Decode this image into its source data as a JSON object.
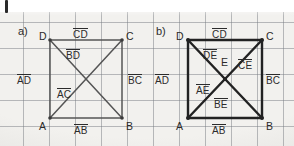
{
  "page": {
    "background_color": "#f2f1ee",
    "grid_color": "#787d82",
    "ink_color": "#2b2b2b",
    "grid_spacing_px": 26,
    "top_tick_mark": "|"
  },
  "panels": [
    {
      "tag": "a)",
      "id": "panel-a",
      "line_weight": "thin",
      "line_color": "#555555",
      "square": {
        "left": 50,
        "top": 40,
        "right": 122,
        "bottom": 118
      },
      "vertices": [
        {
          "name": "D",
          "label": "D",
          "x": 39,
          "y": 31
        },
        {
          "name": "C",
          "label": "C",
          "x": 126,
          "y": 31
        },
        {
          "name": "A",
          "label": "A",
          "x": 39,
          "y": 121
        },
        {
          "name": "B",
          "label": "B",
          "x": 126,
          "y": 121
        }
      ],
      "segment_labels": [
        {
          "name": "CD",
          "label": "CD",
          "overline": true,
          "x": 73,
          "y": 28
        },
        {
          "name": "BD",
          "label": "BD",
          "overline": true,
          "x": 66,
          "y": 49
        },
        {
          "name": "AD",
          "label": "AD",
          "overline": true,
          "x": 17,
          "y": 74
        },
        {
          "name": "AC",
          "label": "AC",
          "overline": true,
          "x": 57,
          "y": 88
        },
        {
          "name": "BC",
          "label": "BC",
          "overline": true,
          "x": 128,
          "y": 74
        },
        {
          "name": "AB",
          "label": "AB",
          "overline": true,
          "x": 74,
          "y": 124
        }
      ],
      "edges": [
        "AB",
        "BC",
        "CD",
        "AD"
      ],
      "diagonals": [
        "AC",
        "BD"
      ]
    },
    {
      "tag": "b)",
      "id": "panel-b",
      "line_weight": "thick",
      "line_color": "#222222",
      "square": {
        "left": 188,
        "top": 40,
        "right": 262,
        "bottom": 118
      },
      "vertices": [
        {
          "name": "D",
          "label": "D",
          "x": 176,
          "y": 31
        },
        {
          "name": "C",
          "label": "C",
          "x": 266,
          "y": 31
        },
        {
          "name": "A",
          "label": "A",
          "x": 176,
          "y": 121
        },
        {
          "name": "B",
          "label": "B",
          "x": 266,
          "y": 121
        },
        {
          "name": "E",
          "label": "E",
          "x": 221,
          "y": 57
        }
      ],
      "segment_labels": [
        {
          "name": "CD",
          "label": "CD",
          "overline": true,
          "x": 212,
          "y": 28
        },
        {
          "name": "DE",
          "label": "DE",
          "overline": true,
          "x": 203,
          "y": 49
        },
        {
          "name": "CE",
          "label": "CE",
          "overline": true,
          "x": 238,
          "y": 59
        },
        {
          "name": "AD",
          "label": "AD",
          "overline": true,
          "x": 155,
          "y": 74
        },
        {
          "name": "AE",
          "label": "AE",
          "overline": true,
          "x": 196,
          "y": 84
        },
        {
          "name": "BE",
          "label": "BE",
          "overline": true,
          "x": 214,
          "y": 98
        },
        {
          "name": "BC",
          "label": "BC",
          "overline": true,
          "x": 266,
          "y": 74
        },
        {
          "name": "AB",
          "label": "AB",
          "overline": true,
          "x": 212,
          "y": 124
        }
      ],
      "edges": [
        "AB",
        "BC",
        "CD",
        "AD"
      ],
      "diagonals": [
        "AC",
        "BD"
      ],
      "center_point": "E"
    }
  ]
}
